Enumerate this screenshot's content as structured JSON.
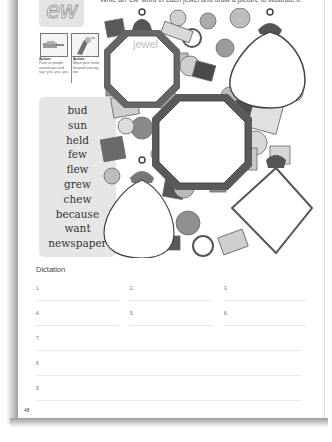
{
  "page": {
    "instruction": "Write an 'ew' word in each jewel and draw a picture to illustrate it.",
    "sound": "ew",
    "actions": [
      {
        "title": "Action:",
        "text": "Point at people around you and say: you, you, you."
      },
      {
        "title": "Action:",
        "text": "Move your head forward and say ew."
      }
    ],
    "word_list": [
      "bud",
      "sun",
      "held",
      "few",
      "flew",
      "grew",
      "chew",
      "because",
      "want",
      "newspaper"
    ],
    "example_jewel_word": "jewel",
    "dictation": {
      "title": "Dictation",
      "items": [
        "1.",
        "2.",
        "3.",
        "4.",
        "5.",
        "6.",
        "7.",
        "8.",
        "9."
      ]
    },
    "page_number": "48"
  }
}
